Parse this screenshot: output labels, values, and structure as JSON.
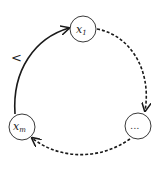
{
  "diagram": {
    "type": "cycle",
    "nodes": [
      {
        "id": "x1",
        "label": "x",
        "subscript": "1"
      },
      {
        "id": "dots",
        "label": "..."
      },
      {
        "id": "xm",
        "label": "x",
        "subscript": "m"
      }
    ],
    "edges": [
      {
        "from": "x1",
        "to": "dots",
        "style": "dashed"
      },
      {
        "from": "dots",
        "to": "xm",
        "style": "dashed"
      },
      {
        "from": "xm",
        "to": "x1",
        "style": "solid",
        "label": "<"
      }
    ],
    "colors": {
      "stroke": "#1a1a1a",
      "node_fill": "#ffffff",
      "background": "#ffffff"
    }
  }
}
